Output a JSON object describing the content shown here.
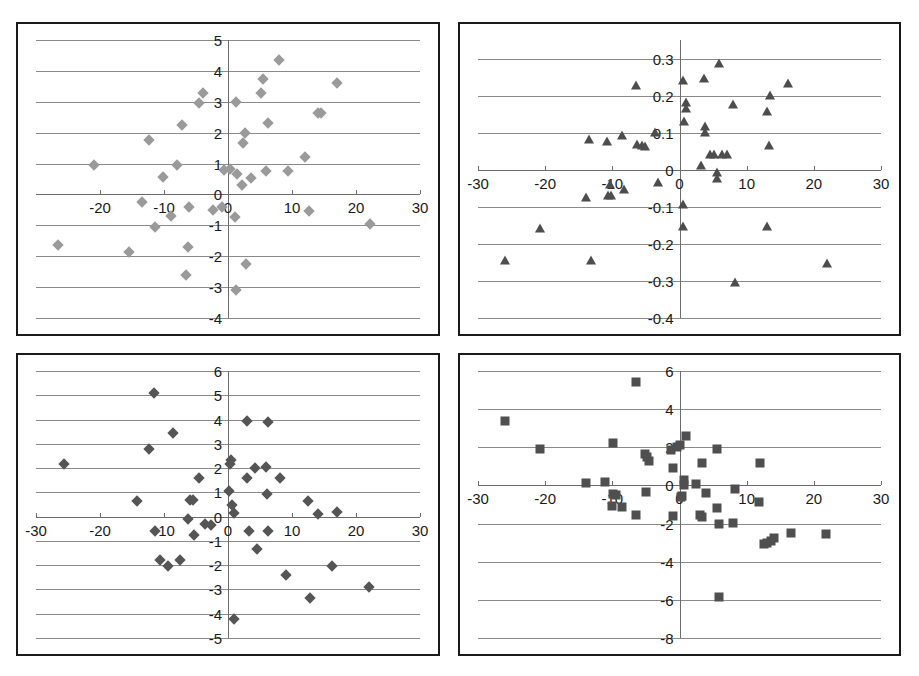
{
  "page": {
    "background": "#ffffff",
    "frame_color": "#1a1a1a",
    "gridline_color": "#8a8a8a"
  },
  "chart_data": [
    {
      "id": "top-left",
      "type": "scatter",
      "title": "",
      "xlabel": "",
      "ylabel": "",
      "marker": "diamond",
      "marker_color": "#9a9a9a",
      "xlim": [
        -30,
        30
      ],
      "ylim": [
        -4,
        5
      ],
      "xticks": [
        -20,
        -10,
        0,
        10,
        20,
        30
      ],
      "xtick_labels": [
        "-20",
        "-10",
        "0",
        "10",
        "20",
        "30"
      ],
      "yticks": [
        5,
        4,
        3,
        2,
        1,
        0,
        -1,
        -2,
        -3,
        -4
      ],
      "ytick_labels": [
        "5",
        "4",
        "3",
        "2",
        "1",
        "0",
        "-1",
        "-2",
        "-3",
        "-4"
      ],
      "grid": true,
      "legend": "none",
      "points": [
        [
          8.0,
          4.35
        ],
        [
          5.5,
          3.75
        ],
        [
          17.0,
          3.6
        ],
        [
          -3.9,
          3.3
        ],
        [
          5.2,
          3.3
        ],
        [
          -4.5,
          2.95
        ],
        [
          1.2,
          3.0
        ],
        [
          14.0,
          2.65
        ],
        [
          14.6,
          2.65
        ],
        [
          6.2,
          2.3
        ],
        [
          -7.2,
          2.25
        ],
        [
          2.6,
          2.0
        ],
        [
          -12.3,
          1.75
        ],
        [
          2.4,
          1.65
        ],
        [
          12.0,
          1.2
        ],
        [
          -21.0,
          0.95
        ],
        [
          -8.0,
          0.95
        ],
        [
          -0.6,
          0.8
        ],
        [
          0.3,
          0.82
        ],
        [
          6.0,
          0.77
        ],
        [
          9.4,
          0.77
        ],
        [
          1.4,
          0.65
        ],
        [
          -10.1,
          0.55
        ],
        [
          3.6,
          0.52
        ],
        [
          2.2,
          0.3
        ],
        [
          -13.5,
          -0.25
        ],
        [
          -0.9,
          -0.4
        ],
        [
          -6.1,
          -0.4
        ],
        [
          -2.4,
          -0.5
        ],
        [
          12.7,
          -0.55
        ],
        [
          -8.9,
          -0.7
        ],
        [
          1.1,
          -0.72
        ],
        [
          -11.4,
          -1.05
        ],
        [
          22.2,
          -0.95
        ],
        [
          -26.5,
          -1.65
        ],
        [
          -6.2,
          -1.7
        ],
        [
          -15.4,
          -1.85
        ],
        [
          -6.6,
          -2.6
        ],
        [
          2.8,
          -2.25
        ],
        [
          1.3,
          -3.1
        ]
      ]
    },
    {
      "id": "top-right",
      "type": "scatter",
      "title": "",
      "xlabel": "",
      "ylabel": "",
      "marker": "triangle",
      "marker_color": "#4d4d4d",
      "xlim": [
        -30,
        30
      ],
      "ylim": [
        -0.4,
        0.35
      ],
      "xticks": [
        -30,
        -20,
        -10,
        0,
        10,
        20,
        30
      ],
      "xtick_labels": [
        "-30",
        "-20",
        "-10",
        "0",
        "10",
        "20",
        "30"
      ],
      "yticks": [
        0.3,
        0.2,
        0.1,
        0,
        -0.1,
        -0.2,
        -0.3,
        -0.4
      ],
      "ytick_labels": [
        "0.3",
        "0.2",
        "0.1",
        "0",
        "-0.1",
        "-0.2",
        "-0.3",
        "-0.4"
      ],
      "grid": true,
      "legend": "none",
      "points": [
        [
          5.9,
          0.285
        ],
        [
          3.6,
          0.245
        ],
        [
          0.5,
          0.24
        ],
        [
          -6.5,
          0.225
        ],
        [
          16.1,
          0.23
        ],
        [
          13.5,
          0.2
        ],
        [
          0.9,
          0.18
        ],
        [
          0.9,
          0.165
        ],
        [
          7.9,
          0.175
        ],
        [
          0.7,
          0.13
        ],
        [
          3.8,
          0.115
        ],
        [
          3.8,
          0.1
        ],
        [
          -3.6,
          0.1
        ],
        [
          -8.6,
          0.09
        ],
        [
          -13.4,
          0.08
        ],
        [
          -10.8,
          0.075
        ],
        [
          -6.4,
          0.068
        ],
        [
          -5.6,
          0.065
        ],
        [
          -5.1,
          0.062
        ],
        [
          13.0,
          0.155
        ],
        [
          13.3,
          0.065
        ],
        [
          4.6,
          0.04
        ],
        [
          5.2,
          0.04
        ],
        [
          6.4,
          0.04
        ],
        [
          7.0,
          0.04
        ],
        [
          3.2,
          0.01
        ],
        [
          5.6,
          -0.01
        ],
        [
          5.6,
          -0.025
        ],
        [
          -3.2,
          -0.035
        ],
        [
          -10.3,
          -0.04
        ],
        [
          -8.3,
          -0.055
        ],
        [
          -13.9,
          -0.075
        ],
        [
          -10.2,
          -0.072
        ],
        [
          -10.7,
          -0.072
        ],
        [
          0.5,
          -0.095
        ],
        [
          0.5,
          -0.155
        ],
        [
          13.0,
          -0.155
        ],
        [
          -20.8,
          -0.16
        ],
        [
          -26.0,
          -0.245
        ],
        [
          -13.2,
          -0.245
        ],
        [
          22.0,
          -0.255
        ],
        [
          8.2,
          -0.305
        ]
      ]
    },
    {
      "id": "bottom-left",
      "type": "scatter",
      "title": "",
      "xlabel": "",
      "ylabel": "",
      "marker": "diamond",
      "marker_color": "#555555",
      "xlim": [
        -30,
        30
      ],
      "ylim": [
        -5,
        6
      ],
      "xticks": [
        -30,
        -20,
        -10,
        0,
        10,
        20,
        30
      ],
      "xtick_labels": [
        "-30",
        "-20",
        "-10",
        "0",
        "10",
        "20",
        "30"
      ],
      "yticks": [
        6,
        5,
        4,
        3,
        2,
        1,
        0,
        -1,
        -2,
        -3,
        -4,
        -5
      ],
      "ytick_labels": [
        "6",
        "5",
        "4",
        "3",
        "2",
        "1",
        "0",
        "-1",
        "-2",
        "-3",
        "-4",
        "-5"
      ],
      "grid": true,
      "legend": "none",
      "points": [
        [
          -11.5,
          5.1
        ],
        [
          3.0,
          3.95
        ],
        [
          6.2,
          3.9
        ],
        [
          -8.6,
          3.45
        ],
        [
          -12.3,
          2.8
        ],
        [
          -25.6,
          2.15
        ],
        [
          0.4,
          2.35
        ],
        [
          0.3,
          2.15
        ],
        [
          4.2,
          2.0
        ],
        [
          5.9,
          2.05
        ],
        [
          -4.5,
          1.6
        ],
        [
          3.0,
          1.6
        ],
        [
          8.1,
          1.6
        ],
        [
          0.1,
          1.05
        ],
        [
          6.1,
          0.95
        ],
        [
          -14.2,
          0.65
        ],
        [
          -5.9,
          0.68
        ],
        [
          -5.4,
          0.68
        ],
        [
          12.5,
          0.65
        ],
        [
          0.7,
          0.5
        ],
        [
          1.0,
          0.15
        ],
        [
          14.0,
          0.12
        ],
        [
          17.0,
          0.18
        ],
        [
          -6.3,
          -0.1
        ],
        [
          -3.6,
          -0.3
        ],
        [
          -2.6,
          -0.35
        ],
        [
          -11.4,
          -0.58
        ],
        [
          -5.3,
          -0.75
        ],
        [
          3.3,
          -0.6
        ],
        [
          6.2,
          -0.6
        ],
        [
          4.6,
          -1.35
        ],
        [
          -10.6,
          -1.8
        ],
        [
          -7.5,
          -1.8
        ],
        [
          -9.4,
          -2.05
        ],
        [
          16.3,
          -2.05
        ],
        [
          9.0,
          -2.4
        ],
        [
          22.0,
          -2.9
        ],
        [
          12.8,
          -3.35
        ],
        [
          1.0,
          -4.2
        ]
      ]
    },
    {
      "id": "bottom-right",
      "type": "scatter",
      "title": "",
      "xlabel": "",
      "ylabel": "",
      "marker": "square",
      "marker_color": "#4f4f4f",
      "xlim": [
        -30,
        30
      ],
      "ylim": [
        -8,
        6
      ],
      "xticks": [
        -30,
        -20,
        -10,
        0,
        10,
        20,
        30
      ],
      "xtick_labels": [
        "-30",
        "-20",
        "-10",
        "0",
        "10",
        "20",
        "30"
      ],
      "yticks": [
        6,
        4,
        2,
        0,
        -2,
        -4,
        -6,
        -8
      ],
      "ytick_labels": [
        "6",
        "4",
        "2",
        "0",
        "-2",
        "-4",
        "-6",
        "-8"
      ],
      "grid": true,
      "legend": "none",
      "points": [
        [
          -6.5,
          5.4
        ],
        [
          -26.0,
          3.4
        ],
        [
          0.9,
          2.6
        ],
        [
          -9.9,
          2.2
        ],
        [
          -20.8,
          1.9
        ],
        [
          -1.3,
          1.85
        ],
        [
          -0.4,
          2.0
        ],
        [
          0.0,
          2.1
        ],
        [
          -5.2,
          1.65
        ],
        [
          -4.9,
          1.5
        ],
        [
          -4.6,
          1.3
        ],
        [
          5.6,
          1.9
        ],
        [
          3.3,
          1.2
        ],
        [
          -0.9,
          0.9
        ],
        [
          12.0,
          1.2
        ],
        [
          -13.9,
          0.15
        ],
        [
          -11.1,
          0.2
        ],
        [
          0.6,
          0.3
        ],
        [
          0.6,
          0.0
        ],
        [
          2.5,
          0.05
        ],
        [
          -9.9,
          -0.45
        ],
        [
          -9.4,
          -0.5
        ],
        [
          4.0,
          -0.4
        ],
        [
          -5.0,
          -0.35
        ],
        [
          8.2,
          -0.2
        ],
        [
          0.3,
          -0.55
        ],
        [
          0.2,
          -0.6
        ],
        [
          -10.1,
          -1.1
        ],
        [
          -8.6,
          -1.15
        ],
        [
          11.9,
          -0.85
        ],
        [
          -6.5,
          -1.55
        ],
        [
          -1.0,
          -1.6
        ],
        [
          3.0,
          -1.55
        ],
        [
          3.4,
          -1.65
        ],
        [
          5.6,
          -1.2
        ],
        [
          5.9,
          -2.0
        ],
        [
          8.0,
          -1.95
        ],
        [
          12.6,
          -3.05
        ],
        [
          13.1,
          -3.0
        ],
        [
          13.6,
          -2.9
        ],
        [
          14.1,
          -2.75
        ],
        [
          16.6,
          -2.5
        ],
        [
          21.8,
          -2.55
        ],
        [
          5.9,
          -5.85
        ]
      ]
    }
  ]
}
